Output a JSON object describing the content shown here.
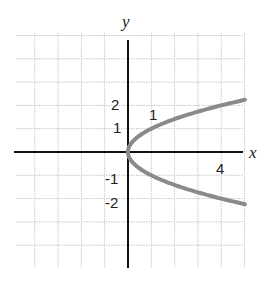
{
  "chart_data": {
    "type": "line",
    "title": "",
    "xlabel": "x",
    "ylabel": "y",
    "equation": "x = y^2",
    "grid": true,
    "xlim": [
      -4,
      5
    ],
    "ylim": [
      -4,
      5
    ],
    "x_tick_labels": [
      {
        "value": 4,
        "label": "4"
      }
    ],
    "y_tick_labels": [
      {
        "value": 2,
        "label": "2"
      },
      {
        "value": 1,
        "label": "1"
      },
      {
        "value": -1,
        "label": "-1"
      },
      {
        "value": -2,
        "label": "-2"
      }
    ],
    "annotations": [
      {
        "text": "1",
        "x": 1,
        "y": 1.5
      }
    ],
    "series": [
      {
        "name": "x = y^2",
        "color": "#8a8a8a",
        "points": [
          {
            "x": 5,
            "y": 2.24
          },
          {
            "x": 4,
            "y": 2
          },
          {
            "x": 2.25,
            "y": 1.5
          },
          {
            "x": 1,
            "y": 1
          },
          {
            "x": 0.25,
            "y": 0.5
          },
          {
            "x": 0,
            "y": 0
          },
          {
            "x": 0.25,
            "y": -0.5
          },
          {
            "x": 1,
            "y": -1
          },
          {
            "x": 2.25,
            "y": -1.5
          },
          {
            "x": 4,
            "y": -2
          },
          {
            "x": 5,
            "y": -2.24
          }
        ]
      }
    ]
  },
  "labels": {
    "x_axis": "x",
    "y_axis": "y",
    "tick_x4": "4",
    "tick_y2": "2",
    "tick_y1": "1",
    "tick_yneg1": "-1",
    "tick_yneg2": "-2",
    "annotation_1": "1"
  }
}
